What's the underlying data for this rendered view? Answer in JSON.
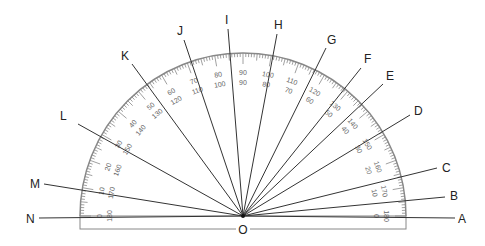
{
  "diagram": {
    "center": {
      "label": "O",
      "x": 243,
      "y": 216
    },
    "protractor": {
      "radius": 163,
      "base_bottom": 229,
      "outer_scale": [
        0,
        10,
        20,
        30,
        40,
        50,
        60,
        70,
        80,
        90,
        100,
        110,
        120,
        130,
        140,
        150,
        160,
        170,
        180
      ],
      "inner_scale": [
        180,
        170,
        160,
        150,
        140,
        130,
        120,
        110,
        100,
        90,
        80,
        70,
        60,
        50,
        40,
        30,
        20,
        10,
        0
      ],
      "color": "#888888"
    },
    "rays": [
      {
        "label": "A",
        "x2": 455,
        "y2": 218,
        "lx": 458,
        "ly": 223
      },
      {
        "label": "B",
        "x2": 445,
        "y2": 197,
        "lx": 450,
        "ly": 200
      },
      {
        "label": "C",
        "x2": 437,
        "y2": 168,
        "lx": 442,
        "ly": 172
      },
      {
        "label": "D",
        "x2": 410,
        "y2": 115,
        "lx": 414,
        "ly": 115
      },
      {
        "label": "E",
        "x2": 383,
        "y2": 84,
        "lx": 386,
        "ly": 80
      },
      {
        "label": "F",
        "x2": 361,
        "y2": 68,
        "lx": 364,
        "ly": 63
      },
      {
        "label": "G",
        "x2": 326,
        "y2": 48,
        "lx": 327,
        "ly": 44
      },
      {
        "label": "H",
        "x2": 277,
        "y2": 34,
        "lx": 274,
        "ly": 29
      },
      {
        "label": "I",
        "x2": 228,
        "y2": 29,
        "lx": 225,
        "ly": 24
      },
      {
        "label": "J",
        "x2": 184,
        "y2": 40,
        "lx": 177,
        "ly": 35
      },
      {
        "label": "K",
        "x2": 132,
        "y2": 64,
        "lx": 121,
        "ly": 60
      },
      {
        "label": "L",
        "x2": 78,
        "y2": 124,
        "lx": 60,
        "ly": 120
      },
      {
        "label": "M",
        "x2": 44,
        "y2": 184,
        "lx": 30,
        "ly": 188
      },
      {
        "label": "N",
        "x2": 39,
        "y2": 218,
        "lx": 26,
        "ly": 223
      }
    ]
  }
}
